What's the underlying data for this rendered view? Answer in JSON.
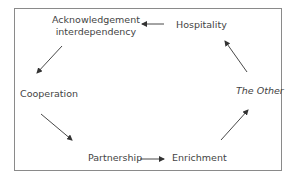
{
  "diagram": {
    "type": "cycle",
    "nodes": {
      "acknowledgement_line1": "Acknowledgement",
      "acknowledgement_line2": "interdependency",
      "hospitality": "Hospitality",
      "cooperation": "Cooperation",
      "the_other": "The Other",
      "partnership": "Partnership",
      "enrichment": "Enrichment"
    },
    "edges": [
      {
        "from": "Hospitality",
        "to": "Acknowledgement interdependency"
      },
      {
        "from": "Acknowledgement interdependency",
        "to": "Cooperation"
      },
      {
        "from": "Cooperation",
        "to": "Partnership"
      },
      {
        "from": "Partnership",
        "to": "Enrichment"
      },
      {
        "from": "Enrichment",
        "to": "The Other"
      },
      {
        "from": "The Other",
        "to": "Hospitality"
      }
    ],
    "colors": {
      "border": "#8a8a8a",
      "arrow": "#333333",
      "text": "#444444"
    }
  }
}
